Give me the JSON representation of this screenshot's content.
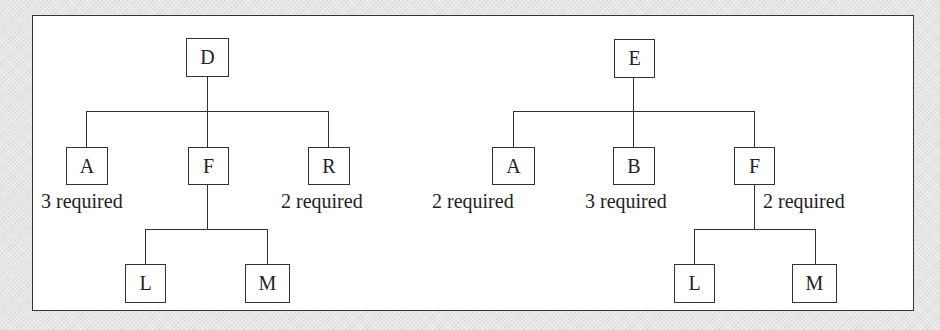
{
  "diagrams": [
    {
      "name": "tree-d",
      "root": {
        "label": "D"
      },
      "children": [
        {
          "label": "A",
          "quantity": "3 required"
        },
        {
          "label": "F",
          "quantity": null,
          "children": [
            {
              "label": "L"
            },
            {
              "label": "M"
            }
          ]
        },
        {
          "label": "R",
          "quantity": "2 required"
        }
      ]
    },
    {
      "name": "tree-e",
      "root": {
        "label": "E"
      },
      "children": [
        {
          "label": "A",
          "quantity": "2 required"
        },
        {
          "label": "B",
          "quantity": "3 required"
        },
        {
          "label": "F",
          "quantity": "2 required",
          "children": [
            {
              "label": "L"
            },
            {
              "label": "M"
            }
          ]
        }
      ]
    }
  ],
  "colors": {
    "line": "#333333",
    "box_fill": "#ffffff",
    "background": "#e6e6e6"
  }
}
